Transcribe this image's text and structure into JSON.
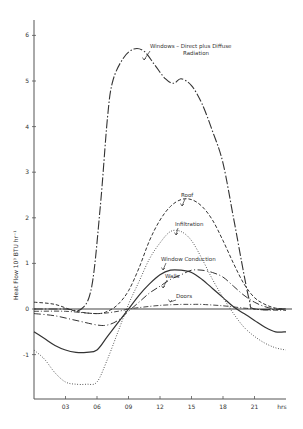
{
  "chart_data": {
    "type": "line",
    "title": "",
    "xlabel": "hrs",
    "ylabel": "Heat Flow 10³ BTU hr⁻¹",
    "ylabel_parts": [
      "Heat",
      "Flow",
      "10",
      "3",
      "BTU",
      "hr",
      "-1"
    ],
    "xlim": [
      0,
      24
    ],
    "ylim": [
      -1.7,
      6.3
    ],
    "x_ticks": [
      3,
      6,
      9,
      12,
      15,
      18,
      21
    ],
    "x_tick_labels": [
      "03",
      "06",
      "09",
      "12",
      "15",
      "18",
      "21"
    ],
    "y_ticks": [
      -1,
      0,
      1,
      2,
      3,
      4,
      5,
      6
    ],
    "y_tick_labels": [
      "-1",
      "0",
      "1",
      "2",
      "3",
      "4",
      "5",
      "6"
    ],
    "grid": false,
    "legend": "inline annotations",
    "series": [
      {
        "name": "Windows - Direct plus Diffuse Radiation",
        "style": "dash-dot",
        "x": [
          0,
          3,
          4.5,
          5.5,
          6.3,
          7,
          7.5,
          8.5,
          9.5,
          10.5,
          11.5,
          12.5,
          13.3,
          14,
          15,
          16,
          17,
          18,
          19,
          19.8,
          20.5,
          21,
          24
        ],
        "values": [
          0,
          0,
          0,
          0.5,
          2.2,
          4.2,
          5.0,
          5.5,
          5.7,
          5.65,
          5.35,
          5.05,
          4.95,
          5.05,
          4.9,
          4.5,
          3.9,
          3.2,
          2.0,
          1.0,
          0.2,
          0,
          0
        ]
      },
      {
        "name": "Roof",
        "style": "dashed",
        "x": [
          0,
          2,
          4,
          6,
          7,
          8,
          9,
          10,
          11,
          12,
          13,
          14,
          15,
          16,
          17,
          18,
          19,
          20,
          21,
          22,
          23,
          24
        ],
        "values": [
          0.15,
          0.1,
          -0.05,
          -0.1,
          -0.05,
          0.1,
          0.4,
          0.9,
          1.5,
          1.95,
          2.25,
          2.4,
          2.4,
          2.25,
          1.95,
          1.5,
          1.0,
          0.55,
          0.25,
          0.1,
          0.02,
          0.0
        ]
      },
      {
        "name": "Infiltration",
        "style": "dotted",
        "x": [
          0,
          1,
          2,
          3,
          4,
          5,
          6,
          7,
          8,
          9,
          10,
          11,
          12,
          13,
          14,
          15,
          16,
          17,
          18,
          19,
          20,
          21,
          22,
          23,
          24
        ],
        "values": [
          -0.9,
          -1.1,
          -1.4,
          -1.6,
          -1.65,
          -1.65,
          -1.6,
          -1.1,
          -0.5,
          0.1,
          0.6,
          1.1,
          1.45,
          1.7,
          1.7,
          1.5,
          1.1,
          0.65,
          0.25,
          -0.1,
          -0.4,
          -0.6,
          -0.75,
          -0.85,
          -0.9
        ]
      },
      {
        "name": "Window Conduction",
        "style": "solid",
        "x": [
          0,
          1,
          2,
          3,
          4,
          5,
          6,
          7,
          8,
          9,
          10,
          11,
          12,
          13,
          14,
          15,
          16,
          17,
          18,
          19,
          20,
          21,
          22,
          23,
          24
        ],
        "values": [
          -0.5,
          -0.65,
          -0.8,
          -0.9,
          -0.95,
          -0.95,
          -0.9,
          -0.6,
          -0.3,
          0.0,
          0.3,
          0.55,
          0.75,
          0.85,
          0.85,
          0.8,
          0.65,
          0.45,
          0.25,
          0.05,
          -0.1,
          -0.25,
          -0.4,
          -0.5,
          -0.5
        ]
      },
      {
        "name": "Walls",
        "style": "long-dash",
        "x": [
          0,
          2,
          4,
          6,
          7,
          8,
          9,
          10,
          11,
          12,
          13,
          14,
          15,
          16,
          17,
          18,
          19,
          20,
          21,
          22,
          23,
          24
        ],
        "values": [
          -0.1,
          -0.15,
          -0.25,
          -0.35,
          -0.35,
          -0.25,
          -0.05,
          0.15,
          0.35,
          0.5,
          0.65,
          0.75,
          0.85,
          0.85,
          0.8,
          0.7,
          0.5,
          0.3,
          0.15,
          0.05,
          0.0,
          0.0
        ]
      },
      {
        "name": "Doors",
        "style": "dash-dot-fine",
        "x": [
          0,
          3,
          6,
          8,
          9,
          10,
          12,
          14,
          15,
          16,
          18,
          20,
          21,
          22,
          24
        ],
        "values": [
          -0.05,
          -0.05,
          -0.1,
          -0.05,
          0.0,
          0.03,
          0.08,
          0.1,
          0.1,
          0.1,
          0.07,
          0.02,
          0.0,
          -0.02,
          -0.03
        ]
      }
    ],
    "annotations": [
      {
        "text_lines": [
          "Windows –  Direct  plus  Diffuse",
          "Radiation"
        ],
        "target": "Windows - Direct plus Diffuse Radiation"
      },
      {
        "text_lines": [
          "Roof"
        ],
        "target": "Roof"
      },
      {
        "text_lines": [
          "Infiltration"
        ],
        "target": "Infiltration"
      },
      {
        "text_lines": [
          "Window  Conduction"
        ],
        "target": "Window Conduction"
      },
      {
        "text_lines": [
          "Walls"
        ],
        "target": "Walls"
      },
      {
        "text_lines": [
          "Doors"
        ],
        "target": "Doors"
      }
    ]
  },
  "labels": {
    "x_unit": "hrs",
    "y_axis": "Heat  Flow  10³  BTU  hr⁻¹"
  }
}
